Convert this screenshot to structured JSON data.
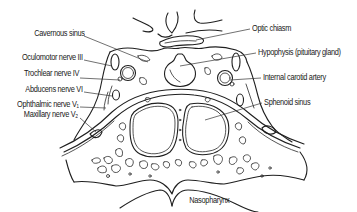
{
  "diagram": {
    "labels_left": [
      {
        "id": "cavernous-sinus",
        "text": "Cavernous sinus"
      },
      {
        "id": "oculomotor-nerve",
        "text": "Oculomotor nerve III"
      },
      {
        "id": "trochlear-nerve",
        "text": "Trochlear nerve IV"
      },
      {
        "id": "abducens-nerve",
        "text": "Abducens nerve VI"
      },
      {
        "id": "ophthalmic-nerve",
        "text": "Ophthalmic  nerve V₁"
      },
      {
        "id": "maxillary-nerve",
        "text": "Maxillary nerve V₂"
      }
    ],
    "labels_right": [
      {
        "id": "optic-chiasm",
        "text": "Optic chiasm"
      },
      {
        "id": "hypophysis",
        "text": "Hypophysis (pituitary gland)"
      },
      {
        "id": "internal-carotid-artery",
        "text": "Internal carotid artery"
      },
      {
        "id": "sphenoid-sinus",
        "text": "Sphenoid sinus"
      }
    ],
    "labels_bottom": [
      {
        "id": "nasopharynx",
        "text": "Nasopharynx"
      }
    ],
    "colors": {
      "line": "#1f1f1f",
      "background": "#ffffff",
      "text": "#1a1a1a"
    }
  }
}
